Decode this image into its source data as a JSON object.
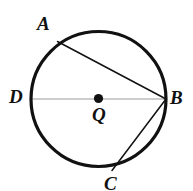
{
  "figure": {
    "name": "circle-with-inscribed-angle",
    "background_color": "#ffffff",
    "width": 193,
    "height": 191
  },
  "circle": {
    "name": "circle-Q",
    "center": {
      "x": 98.5,
      "y": 99
    },
    "radius": 67.5,
    "stroke_color": "#111111",
    "stroke_width": 3.2,
    "fill": "none"
  },
  "center_point": {
    "name": "center-dot-Q",
    "x": 98.5,
    "y": 98.5,
    "radius": 4.6,
    "color": "#111111"
  },
  "points": [
    {
      "id": "A",
      "label": "A",
      "x": 57.5,
      "y": 41.5
    },
    {
      "id": "B",
      "label": "B",
      "x": 166,
      "y": 99
    },
    {
      "id": "C",
      "label": "C",
      "x": 112,
      "y": 170.5
    },
    {
      "id": "D",
      "label": "D",
      "x": 31,
      "y": 99
    },
    {
      "id": "Q",
      "label": "Q",
      "x": 98.5,
      "y": 99
    }
  ],
  "segments": [
    {
      "name": "chord-AB",
      "from": "A",
      "to": "B",
      "x1": 57.5,
      "y1": 41.5,
      "x2": 166,
      "y2": 99,
      "stroke_color": "#111111",
      "stroke_width": 1.5,
      "style": "solid"
    },
    {
      "name": "chord-BC",
      "from": "B",
      "to": "C",
      "x1": 166,
      "y1": 99,
      "x2": 112,
      "y2": 170.5,
      "stroke_color": "#111111",
      "stroke_width": 1.5,
      "style": "solid"
    },
    {
      "name": "diameter-DB",
      "from": "D",
      "to": "B",
      "x1": 31,
      "y1": 99,
      "x2": 166,
      "y2": 99,
      "stroke_color": "#bdbdbd",
      "stroke_width": 1.5,
      "style": "solid"
    }
  ],
  "labels": {
    "A": "A",
    "B": "B",
    "C": "C",
    "D": "D",
    "Q": "Q"
  }
}
